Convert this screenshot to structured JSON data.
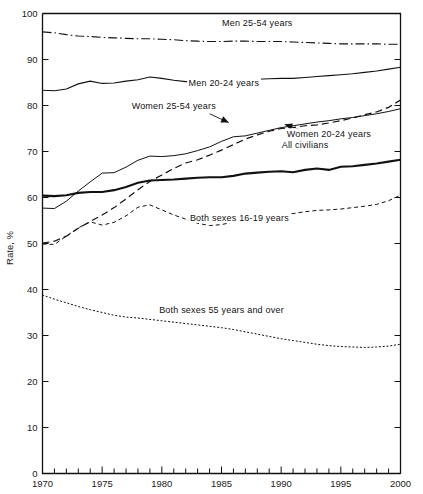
{
  "chart_data": {
    "type": "line",
    "title": "",
    "xlabel": "",
    "ylabel": "Rate, %",
    "xlim": [
      1970,
      2000
    ],
    "ylim": [
      0,
      100
    ],
    "grid": false,
    "legend_position": "inline-annotations",
    "x_tick_labels": [
      "1970",
      "1975",
      "1980",
      "1985",
      "1990",
      "1995",
      "2000"
    ],
    "x_major_ticks": [
      1970,
      1975,
      1980,
      1985,
      1990,
      1995,
      2000
    ],
    "x_minor_tick_interval": 1,
    "y_tick_labels": [
      "0",
      "10",
      "20",
      "30",
      "40",
      "50",
      "60",
      "70",
      "80",
      "90",
      "100"
    ],
    "y_major_ticks": [
      0,
      10,
      20,
      30,
      40,
      50,
      60,
      70,
      80,
      90,
      100
    ],
    "x": [
      1970,
      1971,
      1972,
      1973,
      1974,
      1975,
      1976,
      1977,
      1978,
      1979,
      1980,
      1981,
      1982,
      1983,
      1984,
      1985,
      1986,
      1987,
      1988,
      1989,
      1990,
      1991,
      1992,
      1993,
      1994,
      1995,
      1996,
      1997,
      1998,
      1999,
      2000
    ],
    "series": [
      {
        "name": "Men 25-54 years",
        "dash": "dash-dot",
        "width": 1.1,
        "label_x": 1988.0,
        "label_y": 97.2,
        "values": [
          96.4,
          96.3,
          96.0,
          95.8,
          95.7,
          95.5,
          95.3,
          95.2,
          95.0,
          94.9,
          94.7,
          94.5,
          94.3,
          94.1,
          94.1,
          94.0,
          94.0,
          94.0,
          94.0,
          94.1,
          94.1,
          93.9,
          93.8,
          93.5,
          91.7,
          91.6,
          91.8,
          91.8,
          91.8,
          91.7,
          91.6
        ],
        "visual_values": [
          96.0,
          95.8,
          95.4,
          95.1,
          95.0,
          94.8,
          94.7,
          94.6,
          94.5,
          94.5,
          94.4,
          94.3,
          94.1,
          94.0,
          93.9,
          93.9,
          94.0,
          94.0,
          93.9,
          93.9,
          93.9,
          93.8,
          93.7,
          93.6,
          93.5,
          93.4,
          93.4,
          93.4,
          93.4,
          93.3,
          93.3
        ]
      },
      {
        "name": "Men 20-24 years",
        "dash": "solid",
        "width": 1.1,
        "label_x": 1985.2,
        "label_y": 84.2,
        "values": [
          83.3,
          83.2,
          83.8,
          84.9,
          85.5,
          84.5,
          85.2,
          85.7,
          86.0,
          86.4,
          85.9,
          85.5,
          84.9,
          84.8,
          85.0,
          85.0,
          85.8,
          85.2,
          85.0,
          85.3,
          84.4,
          83.7,
          83.3,
          83.2,
          83.1,
          83.1,
          82.5,
          82.5,
          82.0,
          81.9,
          82.6
        ],
        "visual_values": [
          83.3,
          83.2,
          83.6,
          84.7,
          85.3,
          84.8,
          84.9,
          85.3,
          85.6,
          86.2,
          85.9,
          85.5,
          85.2,
          85.3,
          85.5,
          85.2,
          85.3,
          85.6,
          85.7,
          85.8,
          85.9,
          85.9,
          86.1,
          86.3,
          86.5,
          86.7,
          86.9,
          87.2,
          87.5,
          87.9,
          88.3
        ]
      },
      {
        "name": "Women 25-54 years",
        "dash": "dashed",
        "width": 1.2,
        "label_x": 1981.0,
        "label_y": 79.3,
        "values": [
          50.1,
          51.2,
          52.0,
          53.5,
          54.7,
          55.8,
          57.3,
          59.0,
          61.2,
          63.2,
          64.8,
          66.3,
          67.4,
          68.0,
          69.0,
          70.0,
          71.2,
          72.4,
          73.3,
          74.1,
          74.8,
          74.9,
          75.5,
          75.4,
          75.9,
          76.4,
          77.0,
          77.6,
          77.7,
          78.0,
          79.0
        ],
        "visual_values": [
          50.1,
          50.5,
          51.6,
          53.3,
          54.8,
          56.2,
          57.8,
          59.7,
          61.7,
          63.5,
          64.9,
          66.3,
          67.5,
          68.2,
          69.2,
          70.3,
          71.5,
          72.7,
          73.6,
          74.4,
          75.0,
          75.2,
          75.6,
          75.8,
          76.2,
          76.7,
          77.3,
          78.0,
          78.6,
          79.6,
          81.2
        ]
      },
      {
        "name": "Women 20-24 years",
        "dash": "solid",
        "width": 1.0,
        "label_x": 1994.0,
        "label_y": 73.2,
        "values": [
          57.7,
          57.8,
          59.1,
          61.1,
          63.1,
          64.1,
          65.0,
          66.5,
          68.3,
          69.0,
          68.9,
          69.6,
          69.8,
          69.9,
          70.4,
          71.8,
          72.4,
          73.0,
          72.7,
          72.4,
          71.3,
          70.1,
          71.2,
          71.3,
          71.0,
          70.3,
          71.3,
          72.7,
          73.0,
          73.2,
          73.1
        ],
        "visual_values": [
          57.7,
          57.6,
          59.2,
          61.4,
          63.4,
          65.3,
          65.4,
          66.6,
          68.1,
          69.0,
          68.9,
          69.1,
          69.5,
          70.2,
          71.0,
          72.2,
          73.2,
          73.4,
          74.0,
          74.6,
          75.2,
          75.6,
          76.0,
          76.4,
          76.7,
          77.1,
          77.4,
          77.8,
          78.2,
          78.7,
          79.3
        ]
      },
      {
        "name": "All civilians",
        "dash": "solid",
        "width": 2.1,
        "label_x": 1992.0,
        "label_y": 70.8,
        "values": [
          60.4,
          60.2,
          60.4,
          60.8,
          61.3,
          61.2,
          61.6,
          62.3,
          63.2,
          63.7,
          63.8,
          63.9,
          64.0,
          64.0,
          64.4,
          64.8,
          65.3,
          65.6,
          65.9,
          66.5,
          66.5,
          66.2,
          66.4,
          66.3,
          66.6,
          66.6,
          66.8,
          67.1,
          67.1,
          67.1,
          67.2
        ],
        "visual_values": [
          60.4,
          60.3,
          60.5,
          61.0,
          61.2,
          61.2,
          61.6,
          62.3,
          63.2,
          63.7,
          63.8,
          63.9,
          64.1,
          64.3,
          64.4,
          64.4,
          64.7,
          65.2,
          65.4,
          65.6,
          65.7,
          65.5,
          66.0,
          66.3,
          66.0,
          66.7,
          66.8,
          67.1,
          67.4,
          67.8,
          68.2
        ]
      },
      {
        "name": "Both sexes 16-19 years",
        "dash": "short-dash",
        "width": 1.0,
        "label_x": 1986.5,
        "label_y": 55.0,
        "values": [
          49.9,
          49.7,
          51.9,
          53.7,
          54.8,
          54.0,
          54.5,
          56.0,
          57.8,
          57.9,
          56.7,
          55.4,
          54.1,
          53.5,
          53.9,
          54.5,
          54.7,
          54.7,
          55.3,
          55.9,
          53.7,
          51.6,
          51.3,
          51.5,
          52.7,
          53.5,
          52.3,
          51.6,
          52.8,
          52.0,
          52.0
        ],
        "visual_values": [
          49.9,
          49.8,
          51.6,
          53.4,
          54.7,
          54.0,
          54.6,
          56.0,
          57.9,
          58.4,
          57.3,
          56.2,
          55.3,
          54.4,
          53.9,
          54.1,
          54.7,
          55.4,
          55.9,
          56.3,
          56.6,
          56.5,
          56.9,
          57.2,
          57.3,
          57.5,
          57.8,
          58.1,
          58.5,
          59.3,
          60.5
        ]
      },
      {
        "name": "Both sexes 55 years and over",
        "dash": "dotted",
        "width": 1.0,
        "label_x": 1985.0,
        "label_y": 35.0,
        "values": [
          38.8,
          37.9,
          37.0,
          36.2,
          35.7,
          34.9,
          34.4,
          34.0,
          34.0,
          33.8,
          33.4,
          33.1,
          32.8,
          32.5,
          32.2,
          31.9,
          31.6,
          31.5,
          31.0,
          30.6,
          30.0,
          29.5,
          29.5,
          29.4,
          30.1,
          30.3,
          30.7,
          31.1,
          31.3,
          31.5,
          32.4
        ],
        "visual_values": [
          38.8,
          37.9,
          37.1,
          36.3,
          35.6,
          35.0,
          34.4,
          34.0,
          33.8,
          33.5,
          33.2,
          32.9,
          32.6,
          32.3,
          32.0,
          31.7,
          31.3,
          30.8,
          30.3,
          29.8,
          29.3,
          28.9,
          28.5,
          28.1,
          27.8,
          27.6,
          27.5,
          27.4,
          27.5,
          27.7,
          28.1
        ]
      }
    ],
    "annotations": [
      {
        "name": "arrow-women-25-54",
        "from_x": 1984.0,
        "from_y": 78.2,
        "to_x": 1985.6,
        "to_y": 76.3
      },
      {
        "name": "arrow-women-20-24",
        "from_x": 1992.3,
        "from_y": 74.1,
        "to_x": 1990.3,
        "to_y": 75.9
      }
    ]
  }
}
